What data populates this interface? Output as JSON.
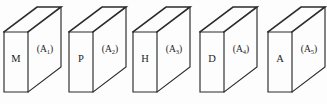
{
  "figure": {
    "type": "technical-diagram",
    "background_color": "#fdfdfd",
    "line_color": "#2b2b2b",
    "text_color": "#1c1c1c"
  },
  "boxes": [
    {
      "id": "box-1",
      "front_label": "M",
      "side_label_base": "(A",
      "side_label_sub": "1",
      "side_label_close": ")",
      "side_label_full": "(A1)",
      "origin_x": 4
    },
    {
      "id": "box-2",
      "front_label": "P",
      "side_label_base": "(A",
      "side_label_sub": "2",
      "side_label_close": ")",
      "side_label_full": "(A2)",
      "origin_x": 69
    },
    {
      "id": "box-3",
      "front_label": "H",
      "side_label_base": "(A",
      "side_label_sub": "3",
      "side_label_close": ")",
      "side_label_full": "(A3)",
      "origin_x": 133
    },
    {
      "id": "box-4",
      "front_label": "D",
      "side_label_base": "(A",
      "side_label_sub": "4",
      "side_label_close": ")",
      "side_label_full": "(A4)",
      "origin_x": 200
    },
    {
      "id": "box-5",
      "front_label": "A",
      "side_label_base": "(A",
      "side_label_sub": "5",
      "side_label_close": ")",
      "side_label_full": "(A5)",
      "origin_x": 268
    }
  ],
  "geometry": {
    "front_width": 24,
    "front_height": 60,
    "front_top_y": 32,
    "depth_dx": 33,
    "depth_dy": -25,
    "front_label_dy": 30,
    "side_label_dx": 17,
    "side_label_dy": 20
  }
}
